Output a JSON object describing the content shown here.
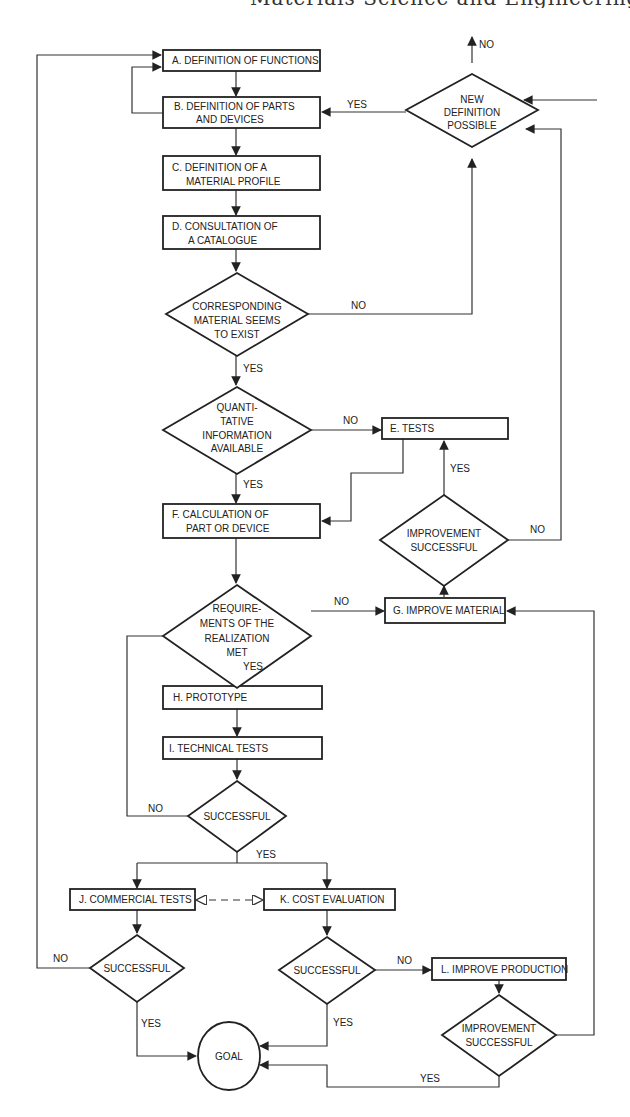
{
  "header": {
    "text": "Materials Science and Engineering"
  },
  "nodes": {
    "A": {
      "label": "A.  DEFINITION OF FUNCTIONS"
    },
    "B": {
      "line1": "B.  DEFINITION OF PARTS",
      "line2": "AND DEVICES"
    },
    "C": {
      "line1": "C.  DEFINITION OF A",
      "line2": "MATERIAL PROFILE"
    },
    "D": {
      "line1": "D.  CONSULTATION OF",
      "line2": "A CATALOGUE"
    },
    "E": {
      "label": "E.  TESTS"
    },
    "F": {
      "line1": "F.  CALCULATION OF",
      "line2": "PART OR DEVICE"
    },
    "G": {
      "label": "G.  IMPROVE MATERIAL"
    },
    "H": {
      "label": "H.  PROTOTYPE"
    },
    "I": {
      "label": "I.  TECHNICAL TESTS"
    },
    "J": {
      "label": "J.  COMMERCIAL TESTS"
    },
    "K": {
      "label": "K.  COST EVALUATION"
    },
    "L": {
      "label": "L. IMPROVE PRODUCTION"
    },
    "goal": {
      "label": "GOAL"
    }
  },
  "decisions": {
    "new_definition": {
      "line1": "NEW",
      "line2": "DEFINITION",
      "line3": "POSSIBLE"
    },
    "corresponding": {
      "line1": "CORRESPONDING",
      "line2": "MATERIAL SEEMS",
      "line3": "TO EXIST"
    },
    "quantitative": {
      "line1": "QUANTI-",
      "line2": "TATIVE",
      "line3": "INFORMATION",
      "line4": "AVAILABLE"
    },
    "improvement_upper": {
      "line1": "IMPROVEMENT",
      "line2": "SUCCESSFUL"
    },
    "requirements": {
      "line1": "REQUIRE-",
      "line2": "MENTS OF THE",
      "line3": "REALIZATION",
      "line4": "MET"
    },
    "successful_tech": {
      "label": "SUCCESSFUL"
    },
    "successful_commercial": {
      "label": "SUCCESSFUL"
    },
    "successful_cost": {
      "label": "SUCCESSFUL"
    },
    "improvement_lower": {
      "line1": "IMPROVEMENT",
      "line2": "SUCCESSFUL"
    }
  },
  "edge_labels": {
    "yes": "YES",
    "no": "NO"
  }
}
